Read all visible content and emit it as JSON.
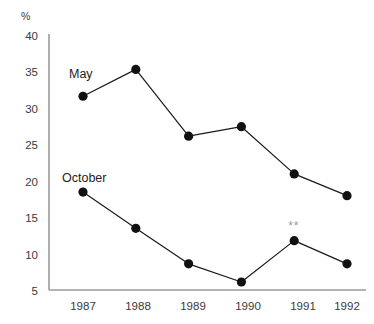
{
  "chart_data": {
    "type": "line",
    "title": "",
    "xlabel": "",
    "ylabel": "%",
    "categories": [
      "1987",
      "1988",
      "1989",
      "1990",
      "1991",
      "1992"
    ],
    "ylim": [
      5,
      40
    ],
    "y_ticks": [
      5,
      10,
      15,
      20,
      25,
      30,
      35,
      40
    ],
    "grid": false,
    "legend_position": "inline-labels",
    "series": [
      {
        "name": "May",
        "values": [
          31.7,
          35.4,
          26.2,
          27.5,
          21.0,
          18.0
        ],
        "color": "#111111",
        "label": "May"
      },
      {
        "name": "October",
        "values": [
          18.5,
          13.5,
          8.6,
          6.1,
          11.8,
          8.6
        ],
        "color": "#111111",
        "label": "October"
      }
    ],
    "annotations": [
      {
        "text": "**",
        "series": "October",
        "category": "1991",
        "color": "#9b9b9b"
      }
    ]
  },
  "axis": {
    "unit_label": "%",
    "y_tick_labels": [
      "40",
      "35",
      "30",
      "25",
      "20",
      "15",
      "10",
      "5"
    ],
    "x_tick_labels": [
      "1987",
      "1988",
      "1989",
      "1990",
      "1991",
      "1992"
    ]
  },
  "series_labels": {
    "may": "May",
    "october": "October"
  },
  "annotation": {
    "significance_mark": "**"
  }
}
